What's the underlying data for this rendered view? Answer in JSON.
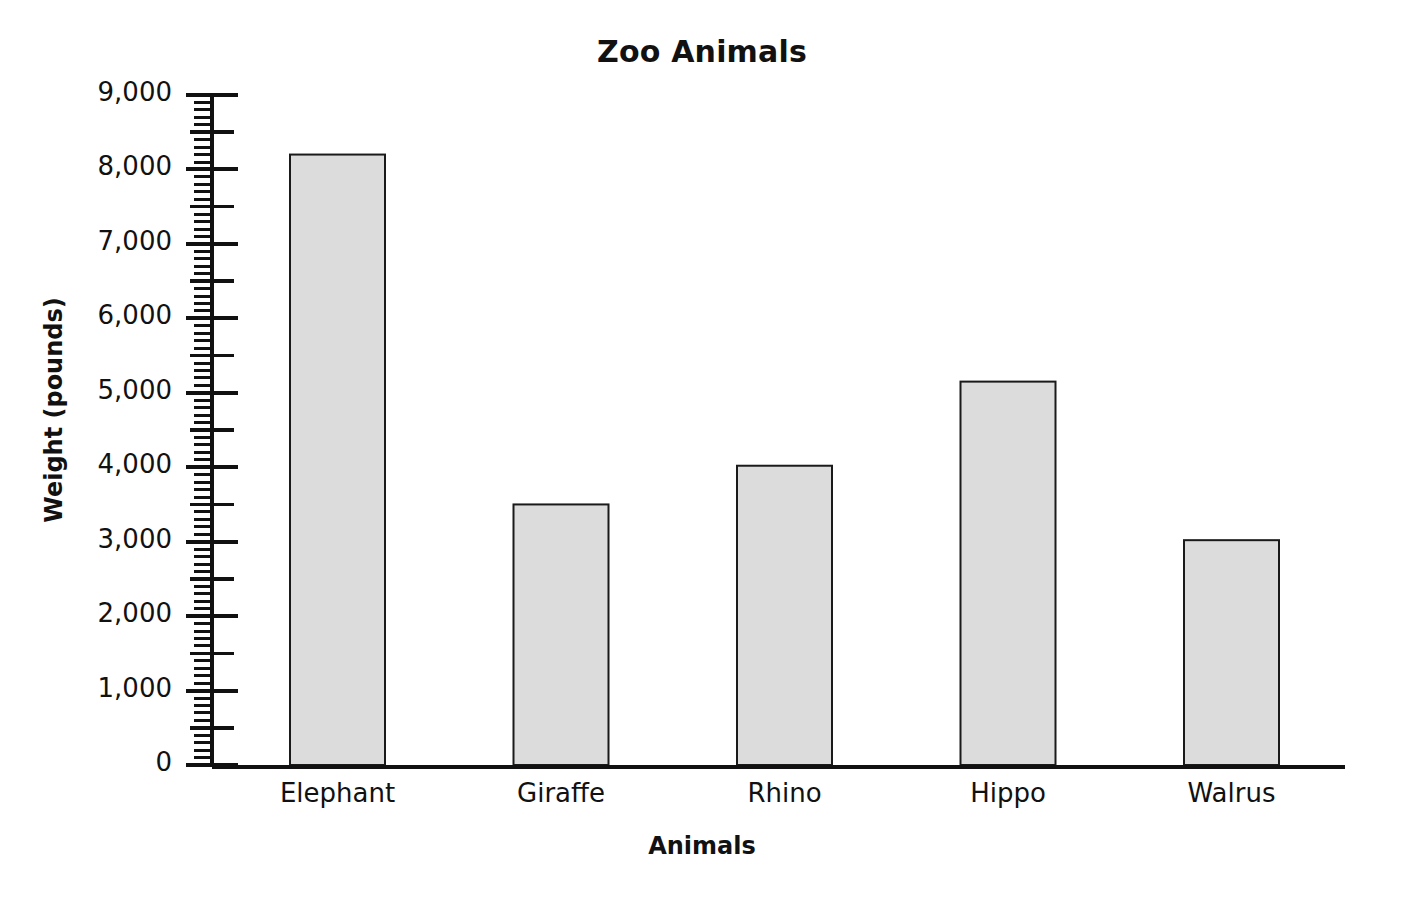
{
  "chart_data": {
    "type": "bar",
    "title": "Zoo Animals",
    "xlabel": "Animals",
    "ylabel": "Weight (pounds)",
    "categories": [
      "Elephant",
      "Giraffe",
      "Rhino",
      "Hippo",
      "Walrus"
    ],
    "values": [
      8200,
      3500,
      4020,
      5150,
      3020
    ],
    "series": [
      {
        "name": "Weight (pounds)",
        "values": [
          8200,
          3500,
          4020,
          5150,
          3020
        ]
      }
    ],
    "ylim": [
      0,
      9000
    ],
    "y_major_step": 1000,
    "y_medium_step": 500,
    "y_minor_step": 100,
    "y_tick_labels": [
      "0",
      "1,000",
      "2,000",
      "3,000",
      "4,000",
      "5,000",
      "6,000",
      "7,000",
      "8,000",
      "9,000"
    ],
    "y_tick_values": [
      0,
      1000,
      2000,
      3000,
      4000,
      5000,
      6000,
      7000,
      8000,
      9000
    ],
    "grid": false,
    "legend": "none",
    "bar_fill_color": "#dcdcdc",
    "bar_border_color": "#1a1a1a",
    "axis_color": "#111111"
  }
}
